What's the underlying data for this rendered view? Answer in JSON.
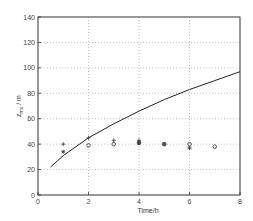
{
  "chart_data": {
    "type": "line",
    "title": "",
    "xlabel": "Time/h",
    "ylabel": "z_mv / m",
    "xlim": [
      0,
      8
    ],
    "ylim": [
      0,
      140
    ],
    "xticks": [
      0,
      2,
      4,
      6,
      8
    ],
    "yticks": [
      0,
      20,
      40,
      60,
      80,
      100,
      120,
      140
    ],
    "grid": true,
    "legend": null,
    "series": [
      {
        "name": "model",
        "style": "line",
        "x": [
          0.5,
          1,
          1.5,
          2,
          3,
          4,
          5,
          6,
          7,
          8
        ],
        "y": [
          22,
          31,
          38,
          45,
          56,
          66,
          75,
          83,
          90,
          97
        ]
      },
      {
        "name": "plus",
        "style": "marker",
        "marker": "+",
        "x": [
          1,
          2,
          3,
          4
        ],
        "y": [
          40,
          45,
          43,
          43
        ]
      },
      {
        "name": "circle",
        "style": "marker",
        "marker": "o",
        "x": [
          2,
          3,
          4,
          5,
          6,
          7
        ],
        "y": [
          39,
          40,
          41,
          40,
          40,
          38
        ]
      },
      {
        "name": "star",
        "style": "marker",
        "marker": "*",
        "x": [
          1,
          4,
          5,
          6
        ],
        "y": [
          34,
          41,
          40,
          37
        ]
      }
    ]
  },
  "plot": {
    "left": 38,
    "right": 240,
    "top": 17,
    "bottom": 195
  }
}
